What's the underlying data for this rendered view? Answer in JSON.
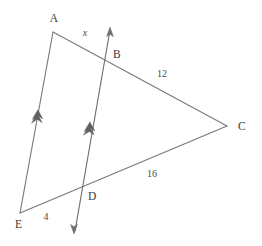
{
  "figure": {
    "background_color": "#ffffff",
    "line_color": "#7a7a7a",
    "label_color": "#3c3c3c"
  },
  "vertices": [
    {
      "id": "A",
      "label": "A",
      "x": 53,
      "y": 32,
      "label_x": 54,
      "label_y": 22
    },
    {
      "id": "B",
      "label": "B",
      "x": 108,
      "y": 57,
      "label_x": 113,
      "label_y": 54
    },
    {
      "id": "C",
      "label": "C",
      "x": 227,
      "y": 126,
      "label_x": 238,
      "label_y": 130
    },
    {
      "id": "D",
      "label": "D",
      "x": 82,
      "y": 192,
      "label_x": 88,
      "label_y": 199
    },
    {
      "id": "E",
      "label": "E",
      "x": 20,
      "y": 213,
      "label_x": 17,
      "label_y": 227
    }
  ],
  "segments": [
    {
      "name": "segment-a-c",
      "from": "A",
      "to": "C",
      "x1": 53,
      "y1": 32,
      "x2": 227,
      "y2": 126
    },
    {
      "name": "segment-e-c",
      "from": "E",
      "to": "C",
      "x1": 20,
      "y1": 213,
      "x2": 227,
      "y2": 126
    },
    {
      "name": "segment-a-e",
      "from": "A",
      "to": "E",
      "x1": 53,
      "y1": 32,
      "x2": 20,
      "y2": 213
    }
  ],
  "ray_bd": {
    "name": "line-b-d",
    "x1": 110,
    "y1": 28,
    "x2": 74,
    "y2": 233,
    "arrow_top": {
      "x": 110,
      "y": 28,
      "angle": -170
    },
    "arrow_bottom": {
      "x": 74,
      "y": 233,
      "angle": 10
    }
  },
  "parallel_marks": [
    {
      "name": "parallel-mark-ae",
      "x": 37,
      "y": 119,
      "angle": -190,
      "chevrons": 2
    },
    {
      "name": "parallel-mark-bd",
      "x": 89,
      "y": 131,
      "angle": -190,
      "chevrons": 2
    }
  ],
  "measurements": [
    {
      "name": "label-x",
      "text": "x",
      "x": 85,
      "y": 36,
      "italic": true
    },
    {
      "name": "label-12",
      "text": "12",
      "x": 162,
      "y": 76,
      "italic": false
    },
    {
      "name": "label-16",
      "text": "16",
      "x": 152,
      "y": 176,
      "italic": false
    },
    {
      "name": "label-4",
      "text": "4",
      "x": 46,
      "y": 219,
      "italic": false
    }
  ]
}
